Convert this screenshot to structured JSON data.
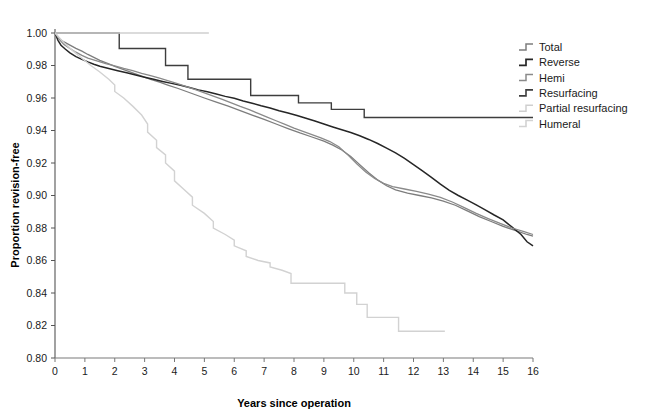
{
  "chart_data": {
    "type": "line",
    "subtype": "kaplan-meier-step",
    "title": "",
    "xlabel": "Years since operation",
    "ylabel": "Proportion revision-free",
    "xlim": [
      0,
      16
    ],
    "ylim": [
      0.8,
      1.0
    ],
    "xticks": [
      "0",
      "1",
      "2",
      "3",
      "4",
      "5",
      "6",
      "7",
      "8",
      "9",
      "10",
      "11",
      "12",
      "13",
      "14",
      "15",
      "16"
    ],
    "yticks": [
      "0.80",
      "0.82",
      "0.84",
      "0.86",
      "0.88",
      "0.90",
      "0.92",
      "0.94",
      "0.96",
      "0.98",
      "1.00"
    ],
    "grid": false,
    "legend_position": "right",
    "series": [
      {
        "name": "Total",
        "color": "#7d7d7d",
        "width": 1.3,
        "points": [
          [
            0,
            1.0
          ],
          [
            0.15,
            0.9965
          ],
          [
            0.3,
            0.9945
          ],
          [
            0.5,
            0.9925
          ],
          [
            0.7,
            0.9905
          ],
          [
            0.9,
            0.9888
          ],
          [
            1.1,
            0.9868
          ],
          [
            1.3,
            0.985
          ],
          [
            1.5,
            0.9832
          ],
          [
            1.8,
            0.981
          ],
          [
            2.0,
            0.9795
          ],
          [
            2.3,
            0.9775
          ],
          [
            2.6,
            0.9755
          ],
          [
            2.9,
            0.9735
          ],
          [
            3.2,
            0.9715
          ],
          [
            3.5,
            0.9697
          ],
          [
            3.8,
            0.9678
          ],
          [
            4.1,
            0.966
          ],
          [
            4.4,
            0.964
          ],
          [
            4.7,
            0.962
          ],
          [
            5.0,
            0.96
          ],
          [
            5.4,
            0.9575
          ],
          [
            5.8,
            0.955
          ],
          [
            6.2,
            0.9522
          ],
          [
            6.6,
            0.9495
          ],
          [
            7.0,
            0.9468
          ],
          [
            7.4,
            0.944
          ],
          [
            7.8,
            0.9412
          ],
          [
            8.2,
            0.9385
          ],
          [
            8.6,
            0.936
          ],
          [
            9.0,
            0.9335
          ],
          [
            9.3,
            0.931
          ],
          [
            9.6,
            0.928
          ],
          [
            9.9,
            0.924
          ],
          [
            10.2,
            0.919
          ],
          [
            10.5,
            0.914
          ],
          [
            10.8,
            0.9095
          ],
          [
            11.1,
            0.906
          ],
          [
            11.4,
            0.9035
          ],
          [
            11.8,
            0.9015
          ],
          [
            12.2,
            0.9
          ],
          [
            12.6,
            0.8985
          ],
          [
            13.0,
            0.8965
          ],
          [
            13.4,
            0.894
          ],
          [
            13.8,
            0.8905
          ],
          [
            14.2,
            0.887
          ],
          [
            14.6,
            0.884
          ],
          [
            15.0,
            0.881
          ],
          [
            15.4,
            0.8785
          ],
          [
            15.8,
            0.876
          ],
          [
            16.0,
            0.875
          ]
        ]
      },
      {
        "name": "Reverse",
        "color": "#262626",
        "width": 1.5,
        "points": [
          [
            0,
            1.0
          ],
          [
            0.1,
            0.9955
          ],
          [
            0.2,
            0.9925
          ],
          [
            0.35,
            0.99
          ],
          [
            0.5,
            0.9878
          ],
          [
            0.7,
            0.9855
          ],
          [
            0.9,
            0.9838
          ],
          [
            1.1,
            0.9822
          ],
          [
            1.3,
            0.9808
          ],
          [
            1.5,
            0.9795
          ],
          [
            1.8,
            0.9782
          ],
          [
            2.1,
            0.9768
          ],
          [
            2.4,
            0.9755
          ],
          [
            2.7,
            0.9742
          ],
          [
            3.0,
            0.9728
          ],
          [
            3.3,
            0.9715
          ],
          [
            3.6,
            0.9702
          ],
          [
            3.9,
            0.969
          ],
          [
            4.2,
            0.9678
          ],
          [
            4.5,
            0.9665
          ],
          [
            4.8,
            0.965
          ],
          [
            5.1,
            0.9638
          ],
          [
            5.4,
            0.9625
          ],
          [
            5.7,
            0.961
          ],
          [
            6.0,
            0.9598
          ],
          [
            6.3,
            0.9582
          ],
          [
            6.6,
            0.9568
          ],
          [
            6.9,
            0.9552
          ],
          [
            7.2,
            0.9538
          ],
          [
            7.5,
            0.9522
          ],
          [
            7.8,
            0.9508
          ],
          [
            8.1,
            0.9492
          ],
          [
            8.4,
            0.9475
          ],
          [
            8.7,
            0.9458
          ],
          [
            9.0,
            0.944
          ],
          [
            9.3,
            0.9422
          ],
          [
            9.6,
            0.9405
          ],
          [
            9.9,
            0.9388
          ],
          [
            10.2,
            0.9368
          ],
          [
            10.5,
            0.9345
          ],
          [
            10.8,
            0.932
          ],
          [
            11.1,
            0.9292
          ],
          [
            11.4,
            0.9262
          ],
          [
            11.7,
            0.9228
          ],
          [
            12.0,
            0.919
          ],
          [
            12.3,
            0.9152
          ],
          [
            12.6,
            0.9112
          ],
          [
            12.9,
            0.907
          ],
          [
            13.2,
            0.9032
          ],
          [
            13.5,
            0.9
          ],
          [
            13.8,
            0.8972
          ],
          [
            14.1,
            0.8942
          ],
          [
            14.4,
            0.8912
          ],
          [
            14.7,
            0.888
          ],
          [
            15.0,
            0.885
          ],
          [
            15.3,
            0.8805
          ],
          [
            15.6,
            0.876
          ],
          [
            15.8,
            0.8715
          ],
          [
            16.0,
            0.869
          ]
        ]
      },
      {
        "name": "Hemi",
        "color": "#8a8a8a",
        "width": 1.3,
        "points": [
          [
            0,
            1.0
          ],
          [
            0.15,
            0.996
          ],
          [
            0.3,
            0.993
          ],
          [
            0.5,
            0.9905
          ],
          [
            0.7,
            0.9882
          ],
          [
            0.9,
            0.9862
          ],
          [
            1.1,
            0.9845
          ],
          [
            1.4,
            0.9828
          ],
          [
            1.7,
            0.9812
          ],
          [
            2.0,
            0.9798
          ],
          [
            2.3,
            0.9782
          ],
          [
            2.6,
            0.9768
          ],
          [
            2.9,
            0.9752
          ],
          [
            3.2,
            0.9738
          ],
          [
            3.5,
            0.9722
          ],
          [
            3.8,
            0.9705
          ],
          [
            4.1,
            0.9688
          ],
          [
            4.4,
            0.967
          ],
          [
            4.7,
            0.9652
          ],
          [
            5.0,
            0.9632
          ],
          [
            5.3,
            0.9612
          ],
          [
            5.6,
            0.9592
          ],
          [
            5.9,
            0.957
          ],
          [
            6.2,
            0.9548
          ],
          [
            6.5,
            0.9528
          ],
          [
            6.8,
            0.9505
          ],
          [
            7.1,
            0.9482
          ],
          [
            7.4,
            0.946
          ],
          [
            7.7,
            0.9438
          ],
          [
            8.0,
            0.9415
          ],
          [
            8.3,
            0.9395
          ],
          [
            8.6,
            0.9375
          ],
          [
            8.9,
            0.9355
          ],
          [
            9.2,
            0.9332
          ],
          [
            9.5,
            0.93
          ],
          [
            9.8,
            0.925
          ],
          [
            10.1,
            0.9195
          ],
          [
            10.4,
            0.9145
          ],
          [
            10.7,
            0.9105
          ],
          [
            11.0,
            0.9075
          ],
          [
            11.3,
            0.9055
          ],
          [
            11.7,
            0.904
          ],
          [
            12.1,
            0.9025
          ],
          [
            12.5,
            0.9008
          ],
          [
            12.9,
            0.8988
          ],
          [
            13.3,
            0.896
          ],
          [
            13.7,
            0.8925
          ],
          [
            14.1,
            0.889
          ],
          [
            14.5,
            0.8858
          ],
          [
            14.9,
            0.8828
          ],
          [
            15.3,
            0.88
          ],
          [
            15.7,
            0.8778
          ],
          [
            16.0,
            0.876
          ]
        ]
      },
      {
        "name": "Resurfacing",
        "color": "#3d3d3d",
        "width": 1.4,
        "points": [
          [
            0,
            1.0
          ],
          [
            2.15,
            1.0
          ],
          [
            2.15,
            0.9905
          ],
          [
            3.7,
            0.9905
          ],
          [
            3.7,
            0.98
          ],
          [
            4.45,
            0.98
          ],
          [
            4.45,
            0.9715
          ],
          [
            6.55,
            0.9715
          ],
          [
            6.55,
            0.9615
          ],
          [
            8.15,
            0.9615
          ],
          [
            8.15,
            0.957
          ],
          [
            9.25,
            0.957
          ],
          [
            9.25,
            0.953
          ],
          [
            10.35,
            0.953
          ],
          [
            10.35,
            0.948
          ],
          [
            16.0,
            0.948
          ]
        ]
      },
      {
        "name": "Partial resurfacing",
        "color": "#cfcfcf",
        "width": 1.3,
        "points": [
          [
            0,
            1.0
          ],
          [
            5.15,
            1.0
          ]
        ]
      },
      {
        "name": "Humeral",
        "color": "#d2d2d2",
        "width": 1.4,
        "points": [
          [
            0,
            1.0
          ],
          [
            0.3,
            0.994
          ],
          [
            0.6,
            0.989
          ],
          [
            0.9,
            0.9845
          ],
          [
            1.2,
            0.98
          ],
          [
            1.5,
            0.976
          ],
          [
            1.8,
            0.9715
          ],
          [
            2.0,
            0.968
          ],
          [
            2.0,
            0.964
          ],
          [
            2.3,
            0.96
          ],
          [
            2.6,
            0.955
          ],
          [
            2.9,
            0.9495
          ],
          [
            3.1,
            0.944
          ],
          [
            3.1,
            0.939
          ],
          [
            3.4,
            0.934
          ],
          [
            3.4,
            0.9295
          ],
          [
            3.7,
            0.925
          ],
          [
            3.7,
            0.92
          ],
          [
            4.0,
            0.915
          ],
          [
            4.0,
            0.909
          ],
          [
            4.3,
            0.904
          ],
          [
            4.6,
            0.899
          ],
          [
            4.6,
            0.894
          ],
          [
            5.0,
            0.889
          ],
          [
            5.3,
            0.884
          ],
          [
            5.3,
            0.88
          ],
          [
            5.7,
            0.876
          ],
          [
            6.0,
            0.8725
          ],
          [
            6.0,
            0.869
          ],
          [
            6.4,
            0.866
          ],
          [
            6.4,
            0.8625
          ],
          [
            6.8,
            0.86
          ],
          [
            7.2,
            0.8585
          ],
          [
            7.2,
            0.856
          ],
          [
            7.6,
            0.854
          ],
          [
            7.9,
            0.852
          ],
          [
            7.9,
            0.846
          ],
          [
            9.7,
            0.846
          ],
          [
            9.7,
            0.84
          ],
          [
            10.1,
            0.84
          ],
          [
            10.1,
            0.833
          ],
          [
            10.45,
            0.833
          ],
          [
            10.45,
            0.825
          ],
          [
            11.5,
            0.825
          ],
          [
            11.5,
            0.8165
          ],
          [
            13.05,
            0.8165
          ]
        ]
      }
    ]
  },
  "legend": {
    "items": [
      {
        "label": "Total"
      },
      {
        "label": "Reverse"
      },
      {
        "label": "Hemi"
      },
      {
        "label": "Resurfacing"
      },
      {
        "label": "Partial resurfacing"
      },
      {
        "label": "Humeral"
      }
    ]
  }
}
